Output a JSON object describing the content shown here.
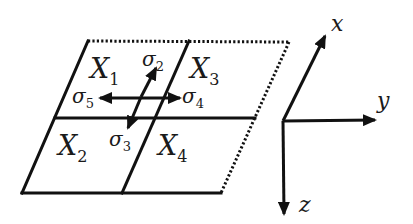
{
  "diagram": {
    "type": "grid-with-coordinate-axes",
    "colors": {
      "stroke": "#111111",
      "background": "#ffffff"
    },
    "cells": [
      {
        "id": "X1",
        "base": "X",
        "sub": "1",
        "position": "top-left"
      },
      {
        "id": "X3",
        "base": "X",
        "sub": "3",
        "position": "top-right"
      },
      {
        "id": "X2",
        "base": "X",
        "sub": "2",
        "position": "bottom-left"
      },
      {
        "id": "X4",
        "base": "X",
        "sub": "4",
        "position": "bottom-right"
      }
    ],
    "arrows": [
      {
        "id": "sigma2",
        "base": "σ",
        "sub": "2",
        "direction": "up-right (toward X1/X3 top)"
      },
      {
        "id": "sigma3",
        "base": "σ",
        "sub": "3",
        "direction": "down-left (toward X2)"
      },
      {
        "id": "sigma4",
        "base": "σ",
        "sub": "4",
        "direction": "right (toward X3)"
      },
      {
        "id": "sigma5",
        "base": "σ",
        "sub": "5",
        "direction": "left (toward X1)"
      }
    ],
    "axes": [
      {
        "id": "x",
        "label": "x",
        "direction": "up-right"
      },
      {
        "id": "y",
        "label": "y",
        "direction": "right"
      },
      {
        "id": "z",
        "label": "z",
        "direction": "down"
      }
    ],
    "edges": {
      "top": "dotted on right half",
      "right": "dotted"
    }
  }
}
